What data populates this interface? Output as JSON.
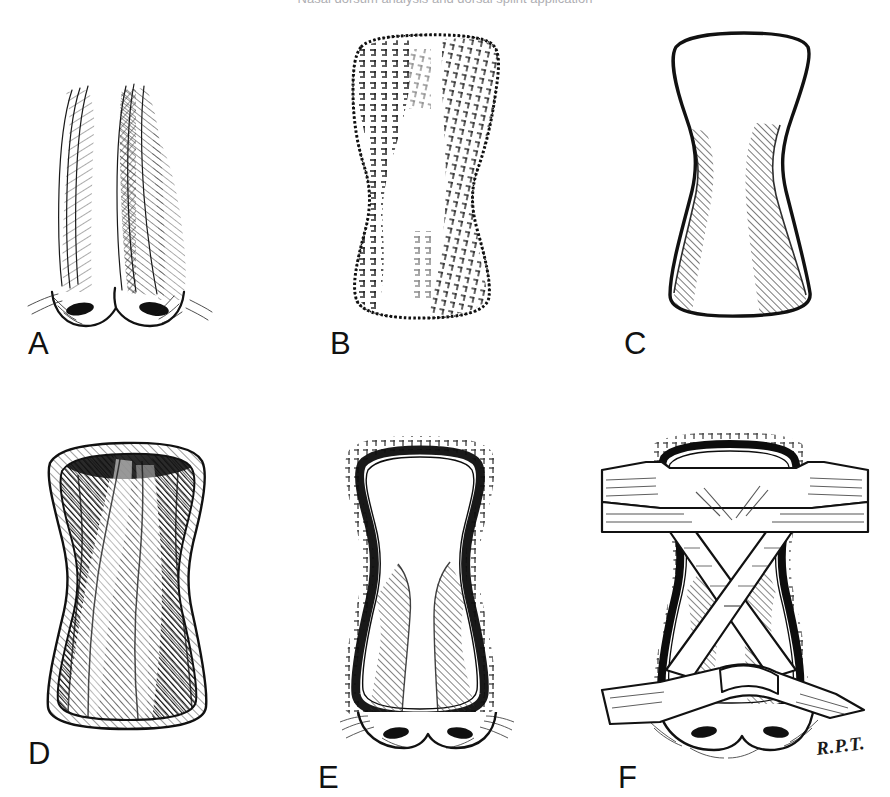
{
  "figure": {
    "title_strip": "Nasal dorsum analysis and dorsal splint application",
    "background_color": "#ffffff",
    "ink_color": "#111111",
    "signature": "R.P.T.",
    "width": 890,
    "height": 797
  },
  "panels": [
    {
      "id": "a",
      "label": "A",
      "name": "frontal-nose-hatched",
      "description": "Frontal view of external nose rendered in fine pen hatching, showing dorsal sidewalls, nasal tip and alar rims with cross-hatched shadow on the patient's left sidewall",
      "label_x": 28,
      "label_y": 328,
      "box_x": 30,
      "box_y": 70,
      "box_w": 180,
      "box_h": 250
    },
    {
      "id": "b",
      "label": "B",
      "name": "hourglass-stipple-template",
      "description": "Hourglass / bowtie shaped splint template with stippled and broken-line texture indicating tape or felt material",
      "label_x": 330,
      "label_y": 328,
      "box_x": 330,
      "box_y": 30,
      "box_w": 190,
      "box_h": 290
    },
    {
      "id": "c",
      "label": "C",
      "name": "hourglass-outline-hatched",
      "description": "Clean hourglass outline with two diagonal hatched bands marking the lateral shaded zones of the dorsum",
      "label_x": 624,
      "label_y": 328,
      "box_x": 640,
      "box_y": 30,
      "box_w": 200,
      "box_h": 290
    },
    {
      "id": "d",
      "label": "D",
      "name": "hourglass-solid-shaded",
      "description": "Hourglass form rendered in dense dark shading with highlighted ridges, representing the contoured splint body",
      "label_x": 28,
      "label_y": 738,
      "box_x": 35,
      "box_y": 440,
      "box_w": 190,
      "box_h": 290
    },
    {
      "id": "e",
      "label": "E",
      "name": "splint-on-nose",
      "description": "Hourglass splint seated on the nasal dorsum with heavy outline, stippled border margin and the nasal tip and alae visible beneath",
      "label_x": 318,
      "label_y": 762,
      "box_x": 325,
      "box_y": 435,
      "box_w": 195,
      "box_h": 310
    },
    {
      "id": "f",
      "label": "F",
      "name": "crossed-tape-fixation",
      "description": "Splinted nose secured with crossing adhesive tape straps forming an X over the dorsum plus transverse straps above and below",
      "label_x": 618,
      "label_y": 762,
      "box_x": 610,
      "box_y": 440,
      "box_w": 255,
      "box_h": 320
    }
  ]
}
